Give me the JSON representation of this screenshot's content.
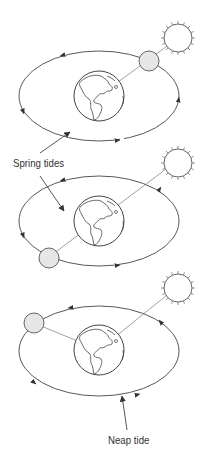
{
  "labels": {
    "spring": "Spring tides",
    "neap": "Neap tide"
  },
  "colors": {
    "line": "#444444",
    "moon_fill": "#e6e6e6",
    "background": "#ffffff"
  },
  "panels": [
    {
      "name": "spring-tide-new-moon",
      "moon_position": "between earth and sun"
    },
    {
      "name": "spring-tide-full-moon",
      "moon_position": "opposite the sun"
    },
    {
      "name": "neap-tide-quarter-moon",
      "moon_position": "at right angle to the sun"
    }
  ]
}
